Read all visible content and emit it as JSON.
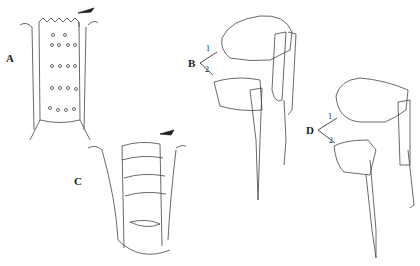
{
  "figure": {
    "panels": [
      {
        "label": "A",
        "desc": "column segment with crenulate top, stippled, rows of pores"
      },
      {
        "label": "C",
        "desc": "segmented column with ringed bands and rows of pores"
      },
      {
        "label": "B",
        "desc": "paired mouthparts, 1 upper and 2 lower"
      },
      {
        "label": "D",
        "desc": "paired mouthparts, 1 upper and 2 lower"
      }
    ],
    "labels": {
      "a": "A",
      "b": "B",
      "c": "C",
      "d": "D",
      "one": "1",
      "two": "2"
    }
  }
}
